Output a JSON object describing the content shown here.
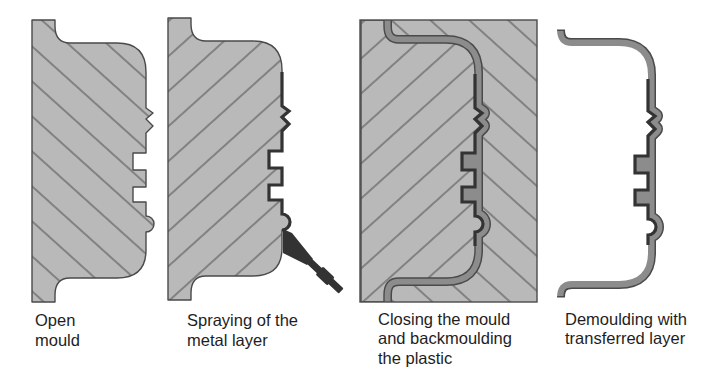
{
  "figure": {
    "panels": [
      {
        "id": "open-mould",
        "label_lines": [
          "Open",
          "mould"
        ]
      },
      {
        "id": "spraying-metal-layer",
        "label_lines": [
          "Spraying of the",
          "metal layer"
        ]
      },
      {
        "id": "closing-and-backmoulding",
        "label_lines": [
          "Closing the mould",
          "and backmoulding",
          "the plastic"
        ]
      },
      {
        "id": "demoulding",
        "label_lines": [
          "Demoulding with",
          "transferred layer"
        ]
      }
    ],
    "colors": {
      "mould_fill": "#b9b9b9",
      "plastic": "#8c8c8c",
      "metal": "#333333",
      "outline": "#4a4a4a",
      "hatch": "#5c5c5c",
      "background": "#ffffff",
      "text": "#1e1e1e"
    }
  }
}
